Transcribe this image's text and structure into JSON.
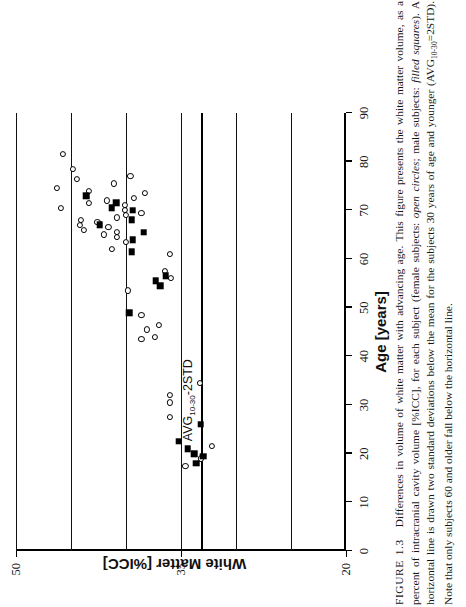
{
  "figure": {
    "label": "FIGURE 1.3",
    "caption_parts": {
      "p1": "Differences in volume of white matter with advancing age. This figure presents the white matter volume, as a percent of intracranial cavity volume [%ICC], for each subject (female subjects: ",
      "em1": "open circles",
      "p2": "; male subjects: ",
      "em2": "filled squares",
      "p3": "). A horizontal line is drawn two standard deviations below the mean for the subjects 30 years of age and younger (AVG",
      "sub1": "10-30",
      "p4": "=2STD). Note that only subjects 60 and older fall below the horizontal line."
    }
  },
  "axes": {
    "x_title": "Age  [years]",
    "y_title": "White Matter [%ICC]",
    "x_ticks": [
      0,
      10,
      20,
      30,
      40,
      50,
      60,
      70,
      80,
      90
    ],
    "y_ticks": [
      20,
      35,
      50
    ],
    "x_range": [
      0,
      90
    ],
    "y_range": [
      20,
      50
    ],
    "gridlines_y": [
      25,
      30,
      35,
      40,
      45,
      50
    ],
    "grid": true
  },
  "threshold": {
    "label_prefix": "AVG",
    "label_sub": "10-30",
    "label_suffix": "-2STD",
    "value": 33.2,
    "orientation": "horizontal-in-data-space"
  },
  "legend": {
    "female": "open circles",
    "male": "filled squares"
  },
  "colors": {
    "ink": "#000000",
    "paper": "#ffffff"
  },
  "chart_data": {
    "type": "scatter",
    "title": "Differences in volume of white matter with advancing age",
    "xlabel": "Age [years]",
    "ylabel": "White Matter [%ICC]",
    "xlim": [
      0,
      90
    ],
    "ylim": [
      20,
      50
    ],
    "grid": true,
    "legend_position": "none",
    "annotations": [
      {
        "text": "AVG(10-30)-2STD",
        "type": "threshold-line",
        "y": 33.2
      }
    ],
    "series": [
      {
        "name": "female subjects",
        "marker": "open circle",
        "points": [
          [
            17.5,
            34.6
          ],
          [
            19.0,
            33.2
          ],
          [
            21.5,
            32.2
          ],
          [
            27.5,
            36.0
          ],
          [
            30.5,
            36.0
          ],
          [
            32.0,
            36.0
          ],
          [
            34.5,
            33.3
          ],
          [
            43.5,
            38.6
          ],
          [
            44.0,
            37.4
          ],
          [
            45.5,
            38.1
          ],
          [
            46.5,
            37.0
          ],
          [
            48.5,
            38.6
          ],
          [
            53.5,
            39.8
          ],
          [
            56.0,
            35.9
          ],
          [
            57.5,
            36.5
          ],
          [
            61.0,
            36.0
          ],
          [
            62.0,
            41.3
          ],
          [
            63.5,
            40.0
          ],
          [
            64.5,
            40.8
          ],
          [
            65.0,
            42.0
          ],
          [
            65.5,
            40.8
          ],
          [
            66.0,
            43.8
          ],
          [
            66.5,
            41.6
          ],
          [
            67.0,
            44.2
          ],
          [
            67.5,
            42.6
          ],
          [
            68.0,
            44.1
          ],
          [
            68.5,
            40.8
          ],
          [
            69.0,
            40.0
          ],
          [
            69.5,
            38.6
          ],
          [
            70.0,
            40.1
          ],
          [
            70.5,
            45.9
          ],
          [
            71.0,
            40.1
          ],
          [
            71.5,
            43.4
          ],
          [
            72.0,
            41.7
          ],
          [
            72.5,
            39.3
          ],
          [
            73.5,
            38.3
          ],
          [
            74.0,
            43.4
          ],
          [
            74.5,
            46.3
          ],
          [
            75.5,
            41.1
          ],
          [
            76.5,
            44.5
          ],
          [
            77.0,
            39.6
          ],
          [
            78.5,
            44.8
          ],
          [
            81.5,
            45.7
          ]
        ]
      },
      {
        "name": "male subjects",
        "marker": "filled square",
        "points": [
          [
            18.0,
            33.6
          ],
          [
            19.5,
            33.0
          ],
          [
            20.0,
            33.8
          ],
          [
            21.0,
            34.4
          ],
          [
            22.5,
            35.2
          ],
          [
            26.0,
            33.2
          ],
          [
            49.0,
            39.7
          ],
          [
            54.5,
            36.9
          ],
          [
            55.5,
            37.3
          ],
          [
            56.5,
            36.4
          ],
          [
            61.5,
            39.5
          ],
          [
            64.0,
            39.4
          ],
          [
            65.5,
            38.4
          ],
          [
            67.0,
            42.4
          ],
          [
            68.0,
            39.5
          ],
          [
            70.0,
            39.4
          ],
          [
            70.5,
            41.3
          ],
          [
            71.5,
            40.9
          ],
          [
            73.0,
            43.6
          ]
        ]
      }
    ]
  }
}
